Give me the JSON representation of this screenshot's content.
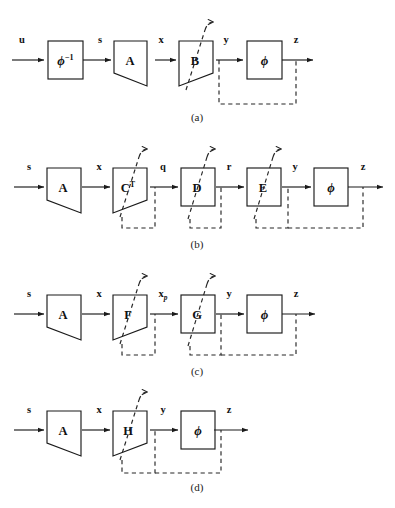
{
  "figure": {
    "background": "#ffffff",
    "ink": "#1a1a1a",
    "dash_color": "#262626",
    "width": 395,
    "height": 508
  },
  "panels": [
    {
      "id": "a",
      "label": "(a)",
      "signals": [
        "u",
        "s",
        "x",
        "y",
        "z"
      ],
      "blocks": [
        {
          "name": "phi-inverse",
          "shape": "rect",
          "label": "ϕ",
          "superscript": "−1",
          "adaptive": false
        },
        {
          "name": "A",
          "shape": "trapezoid",
          "label": "A",
          "superscript": "",
          "adaptive": false
        },
        {
          "name": "B",
          "shape": "trapezoid",
          "label": "B",
          "superscript": "",
          "adaptive": true
        },
        {
          "name": "phi",
          "shape": "rect",
          "label": "ϕ",
          "superscript": "",
          "adaptive": false
        }
      ],
      "feedback_taps": [
        "y",
        "z"
      ]
    },
    {
      "id": "b",
      "label": "(b)",
      "signals": [
        "s",
        "x",
        "q",
        "r",
        "y",
        "z"
      ],
      "blocks": [
        {
          "name": "A",
          "shape": "trapezoid",
          "label": "A",
          "superscript": "",
          "adaptive": false
        },
        {
          "name": "C-transpose",
          "shape": "trapezoid",
          "label": "C",
          "superscript": "T",
          "adaptive": true
        },
        {
          "name": "D",
          "shape": "rect",
          "label": "D",
          "superscript": "",
          "adaptive": true
        },
        {
          "name": "E",
          "shape": "rect",
          "label": "E",
          "superscript": "",
          "adaptive": true
        },
        {
          "name": "phi",
          "shape": "rect",
          "label": "ϕ",
          "superscript": "",
          "adaptive": false
        }
      ],
      "feedback_taps": [
        "q",
        "r",
        "y",
        "z"
      ]
    },
    {
      "id": "c",
      "label": "(c)",
      "signals": [
        "s",
        "x",
        "x_p",
        "y",
        "z"
      ],
      "blocks": [
        {
          "name": "A",
          "shape": "trapezoid",
          "label": "A",
          "superscript": "",
          "adaptive": false
        },
        {
          "name": "F",
          "shape": "trapezoid",
          "label": "F",
          "superscript": "",
          "adaptive": true
        },
        {
          "name": "G",
          "shape": "rect",
          "label": "G",
          "superscript": "",
          "adaptive": true
        },
        {
          "name": "phi",
          "shape": "rect",
          "label": "ϕ",
          "superscript": "",
          "adaptive": false
        }
      ],
      "feedback_taps": [
        "x_p",
        "y",
        "z"
      ]
    },
    {
      "id": "d",
      "label": "(d)",
      "signals": [
        "s",
        "x",
        "y",
        "z"
      ],
      "blocks": [
        {
          "name": "A",
          "shape": "trapezoid",
          "label": "A",
          "superscript": "",
          "adaptive": false
        },
        {
          "name": "H",
          "shape": "trapezoid",
          "label": "H",
          "superscript": "",
          "adaptive": true
        },
        {
          "name": "phi",
          "shape": "rect",
          "label": "ϕ",
          "superscript": "",
          "adaptive": false
        }
      ],
      "feedback_taps": [
        "y",
        "z"
      ]
    }
  ],
  "panel_a": {
    "label": "(a)",
    "sig_u": "u",
    "sig_s": "s",
    "sig_x": "x",
    "sig_y": "y",
    "sig_z": "z",
    "blk_phiinv": "ϕ",
    "blk_phiinv_sup": "−1",
    "blk_A": "A",
    "blk_B": "B",
    "blk_phi": "ϕ"
  },
  "panel_b": {
    "label": "(b)",
    "sig_s": "s",
    "sig_x": "x",
    "sig_q": "q",
    "sig_r": "r",
    "sig_y": "y",
    "sig_z": "z",
    "blk_A": "A",
    "blk_C": "C",
    "blk_C_sup": "T",
    "blk_D": "D",
    "blk_E": "E",
    "blk_phi": "ϕ"
  },
  "panel_c": {
    "label": "(c)",
    "sig_s": "s",
    "sig_x": "x",
    "sig_xp_base": "x",
    "sig_xp_sub": "p",
    "sig_y": "y",
    "sig_z": "z",
    "blk_A": "A",
    "blk_F": "F",
    "blk_G": "G",
    "blk_phi": "ϕ"
  },
  "panel_d": {
    "label": "(d)",
    "sig_s": "s",
    "sig_x": "x",
    "sig_y": "y",
    "sig_z": "z",
    "blk_A": "A",
    "blk_H": "H",
    "blk_phi": "ϕ"
  },
  "page_caption": {
    "text": ""
  }
}
